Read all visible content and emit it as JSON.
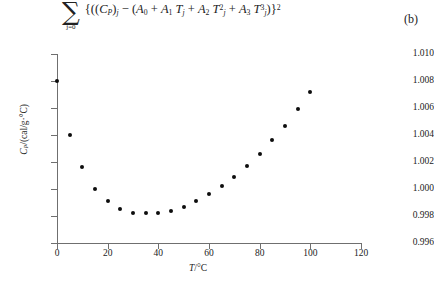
{
  "formula": {
    "sum_symbol": "∑",
    "limit_top": "20",
    "limit_bottom": "j=0",
    "expression_text": "{((C_P)_j − (A_0 + A_1 T_j + A_2 T_j^2 + A_3 T_j^3)}^2",
    "tokens": {
      "open": "{((",
      "cp": "C",
      "cp_sub": "P",
      "close_paren_sub": ")",
      "j_sub": "j",
      "minus": "−",
      "open2": "(",
      "a0": "A",
      "a0_sub": "0",
      "plus": "+",
      "a1": "A",
      "a1_sub": "1",
      "t1": "T",
      "t1_sub": "j",
      "a2": "A",
      "a2_sub": "2",
      "t2": "T",
      "t2_sub": "j",
      "t2_sup": "2",
      "a3": "A",
      "a3_sub": "3",
      "t3": "T",
      "t3_sub": "j",
      "t3_sup": "3",
      "close": ")}",
      "outer_sup": "2"
    }
  },
  "panel_label": "(b)",
  "chart_data": {
    "type": "scatter",
    "title": "",
    "xlabel": "T/°C",
    "ylabel": "C_P/(cal/g·°C)",
    "xlabel_tokens": {
      "t": "T",
      "slash_unit": "/°C"
    },
    "ylabel_tokens": {
      "c": "C",
      "p": "P",
      "unit": "/(cal/g·°C)"
    },
    "xlim": [
      0,
      120
    ],
    "ylim": [
      0.996,
      1.01
    ],
    "xticks": [
      0,
      20,
      40,
      60,
      80,
      100,
      120
    ],
    "xtick_labels": [
      "0",
      "20",
      "40",
      "60",
      "80",
      "100",
      "120"
    ],
    "yticks": [
      0.996,
      0.998,
      1.0,
      1.002,
      1.004,
      1.006,
      1.008,
      1.01
    ],
    "ytick_labels": [
      "0.996",
      "0.998",
      "1.000",
      "1.002",
      "1.004",
      "1.006",
      "1.008",
      "1.010"
    ],
    "grid": false,
    "legend": "none",
    "marker": "filled-diamond",
    "marker_color": "#0d0d0d",
    "axis_color": "#6f6f6f",
    "x": [
      0,
      5,
      10,
      15,
      20,
      25,
      30,
      35,
      40,
      45,
      50,
      55,
      60,
      65,
      70,
      75,
      80,
      85,
      90,
      95,
      100
    ],
    "y": [
      1.008,
      1.004,
      1.0016,
      1.0,
      0.9991,
      0.9985,
      0.9982,
      0.9982,
      0.9982,
      0.9984,
      0.9987,
      0.9991,
      0.9996,
      1.0002,
      1.0009,
      1.0017,
      1.0026,
      1.0036,
      1.0047,
      1.0059,
      1.0072
    ],
    "series": [
      {
        "name": "Cp measurements",
        "values": [
          1.008,
          1.004,
          1.0016,
          1.0,
          0.9991,
          0.9985,
          0.9982,
          0.9982,
          0.9982,
          0.9984,
          0.9987,
          0.9991,
          0.9996,
          1.0002,
          1.0009,
          1.0017,
          1.0026,
          1.0036,
          1.0047,
          1.0059,
          1.0072
        ]
      }
    ]
  }
}
